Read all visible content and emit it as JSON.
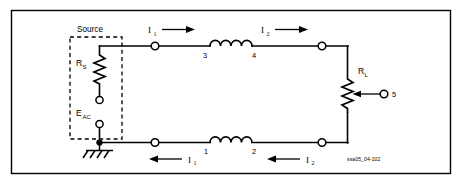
{
  "figure": {
    "caption_id": "ssa05_04-102",
    "labels": {
      "source": "Source",
      "source_resistance": "R",
      "source_resistance_sub": "S",
      "source_voltage": "E",
      "source_voltage_sub": "AC",
      "load_resistance": "R",
      "load_resistance_sub": "L"
    },
    "terminal_numbers": {
      "coil_bottom_left": "1",
      "coil_bottom_right": "2",
      "coil_top_left": "3",
      "coil_top_right": "4",
      "wiper": "5"
    },
    "currents": [
      {
        "name": "current-top-left",
        "symbol": "I",
        "sub": "1",
        "direction": "right"
      },
      {
        "name": "current-top-right",
        "symbol": "I",
        "sub": "2",
        "direction": "right"
      },
      {
        "name": "current-bottom-left",
        "symbol": "I",
        "sub": "1",
        "direction": "left"
      },
      {
        "name": "current-bottom-right",
        "symbol": "I",
        "sub": "2",
        "direction": "left"
      }
    ],
    "components": [
      {
        "name": "source-resistor",
        "type": "resistor",
        "label": "RS"
      },
      {
        "name": "source-ac",
        "type": "ac-source",
        "label": "EAC"
      },
      {
        "name": "inductor-top",
        "type": "inductor",
        "terminals": [
          "3",
          "4"
        ]
      },
      {
        "name": "inductor-bottom",
        "type": "inductor",
        "terminals": [
          "1",
          "2"
        ]
      },
      {
        "name": "load-potentiometer",
        "type": "potentiometer",
        "label": "RL",
        "wiper_terminal": "5"
      },
      {
        "name": "ground",
        "type": "earth-ground"
      }
    ],
    "colors": {
      "ink": "#000000",
      "background": "#ffffff"
    }
  }
}
